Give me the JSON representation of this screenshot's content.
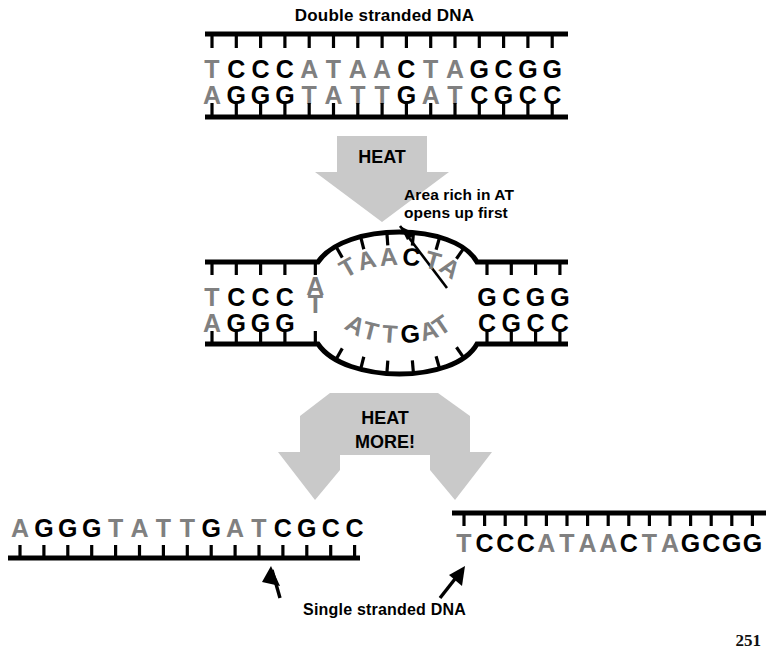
{
  "figure": {
    "title": "Double stranded DNA",
    "annotation": "Area rich in AT\nopens up first",
    "caption": "Single stranded DNA",
    "page_number": "251",
    "colors": {
      "base_at": "#808080",
      "base_gc": "#000000",
      "backbone": "#000000",
      "arrow_fill": "#c9c9c9",
      "arrow_text": "#000000",
      "background": "#ffffff"
    },
    "arrows": {
      "heat": "HEAT",
      "heat_more": "HEAT\nMORE!",
      "heat_more_line1": "HEAT",
      "heat_more_line2": "MORE!"
    }
  },
  "duplex_top": {
    "label": "Double stranded DNA",
    "top_strand": [
      "T",
      "C",
      "C",
      "C",
      "A",
      "T",
      "A",
      "A",
      "C",
      "T",
      "A",
      "G",
      "C",
      "G",
      "G"
    ],
    "bottom_strand": [
      "A",
      "G",
      "G",
      "G",
      "T",
      "A",
      "T",
      "T",
      "G",
      "A",
      "T",
      "C",
      "G",
      "C",
      "C"
    ],
    "base_pairs": 15
  },
  "duplex_bubble": {
    "left_flank_top": [
      "T",
      "C",
      "C",
      "C"
    ],
    "left_flank_bottom": [
      "A",
      "G",
      "G",
      "G"
    ],
    "bubble_top": [
      "A",
      "T",
      "A",
      "A",
      "C",
      "T",
      "A"
    ],
    "bubble_bottom": [
      "T",
      "A",
      "T",
      "T",
      "G",
      "A",
      "T"
    ],
    "right_flank_top": [
      "G",
      "C",
      "G",
      "G"
    ],
    "right_flank_bottom": [
      "C",
      "G",
      "C",
      "C"
    ]
  },
  "single_strands": {
    "left": {
      "sequence": [
        "A",
        "G",
        "G",
        "G",
        "T",
        "A",
        "T",
        "T",
        "G",
        "A",
        "T",
        "C",
        "G",
        "C",
        "C"
      ],
      "backbone_position": "below"
    },
    "right": {
      "sequence": [
        "T",
        "C",
        "C",
        "C",
        "A",
        "T",
        "A",
        "A",
        "C",
        "T",
        "A",
        "G",
        "C",
        "G",
        "G"
      ],
      "backbone_position": "above"
    }
  }
}
